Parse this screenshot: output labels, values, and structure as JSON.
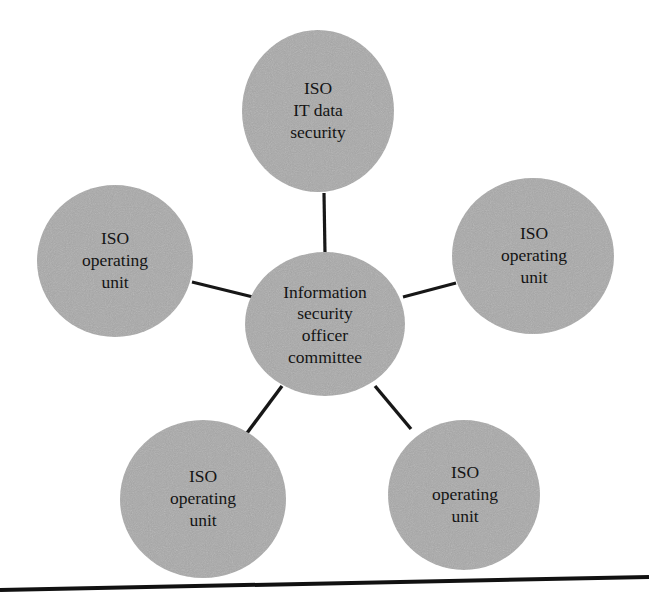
{
  "figure": {
    "type": "hub-and-spoke-diagram",
    "background_color": "#ffffff",
    "node_fill_color": "#a9a9a9",
    "node_edge_color": "#a0a0a0",
    "connector_color": "#171717",
    "text_color": "#141414"
  },
  "center_node": {
    "id": "information-security-officer-committee",
    "lines": [
      "Information",
      "security",
      "officer",
      "committee"
    ],
    "line1": "Information",
    "line2": "security",
    "line3": "officer",
    "line4": "committee",
    "cx": 325,
    "cy": 324,
    "rx": 80,
    "ry": 72
  },
  "satellites": [
    {
      "id": "iso-it-data-security",
      "position": "top",
      "lines": [
        "ISO",
        "IT data",
        "security"
      ],
      "line1": "ISO",
      "line2": "IT data",
      "line3": "security",
      "cx": 318,
      "cy": 111,
      "rx": 76,
      "ry": 81
    },
    {
      "id": "iso-operating-unit-left",
      "position": "upper-left",
      "lines": [
        "ISO",
        "operating",
        "unit"
      ],
      "line1": "ISO",
      "line2": "operating",
      "line3": "unit",
      "cx": 115,
      "cy": 261,
      "rx": 78,
      "ry": 76
    },
    {
      "id": "iso-operating-unit-right",
      "position": "upper-right",
      "lines": [
        "ISO",
        "operating",
        "unit"
      ],
      "line1": "ISO",
      "line2": "operating",
      "line3": "unit",
      "cx": 533,
      "cy": 256,
      "rx": 81,
      "ry": 78
    },
    {
      "id": "iso-operating-unit-bottom-left",
      "position": "lower-left",
      "lines": [
        "ISO",
        "operating",
        "unit"
      ],
      "line1": "ISO",
      "line2": "operating",
      "line3": "unit",
      "cx": 203,
      "cy": 499,
      "rx": 83,
      "ry": 79
    },
    {
      "id": "iso-operating-unit-bottom-right",
      "position": "lower-right",
      "lines": [
        "ISO",
        "operating",
        "unit"
      ],
      "line1": "ISO",
      "line2": "operating",
      "line3": "unit",
      "cx": 464,
      "cy": 495,
      "rx": 76,
      "ry": 75
    }
  ],
  "connectors": [
    {
      "id": "connector-center-to-top",
      "x1": 324,
      "y1": 193,
      "x2": 325,
      "y2": 254
    },
    {
      "id": "connector-center-to-upper-left",
      "x1": 192,
      "y1": 282,
      "x2": 253,
      "y2": 297
    },
    {
      "id": "connector-center-to-upper-right",
      "x1": 403,
      "y1": 297,
      "x2": 456,
      "y2": 283
    },
    {
      "id": "connector-center-to-lower-left",
      "x1": 282,
      "y1": 386,
      "x2": 247,
      "y2": 433
    },
    {
      "id": "connector-center-to-lower-right",
      "x1": 375,
      "y1": 386,
      "x2": 411,
      "y2": 429
    }
  ],
  "page_rule": {
    "id": "bottom-horizontal-rule",
    "x1": 0,
    "y1": 590,
    "x2": 649,
    "y2": 577
  }
}
